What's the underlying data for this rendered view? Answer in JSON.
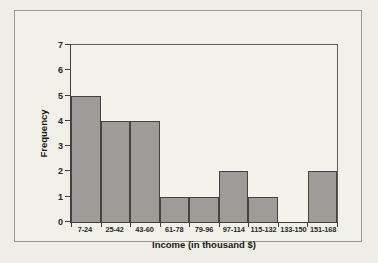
{
  "chart_data": {
    "type": "bar",
    "title": "",
    "xlabel": "Income (in thousand $)",
    "ylabel": "Frequency",
    "categories": [
      "7-24",
      "25-42",
      "43-60",
      "61-78",
      "79-96",
      "97-114",
      "115-132",
      "133-150",
      "151-168"
    ],
    "values": [
      5,
      4,
      4,
      1,
      1,
      2,
      1,
      0,
      2
    ],
    "ylim": [
      0,
      7
    ],
    "yticks": [
      0,
      1,
      2,
      3,
      4,
      5,
      6,
      7
    ],
    "grid": false,
    "legend": null,
    "bar_color": "#9d9c98",
    "bar_edge_color": "#43433f",
    "plot_background": "#f4f3eb",
    "figure_background": "#efeee6"
  }
}
